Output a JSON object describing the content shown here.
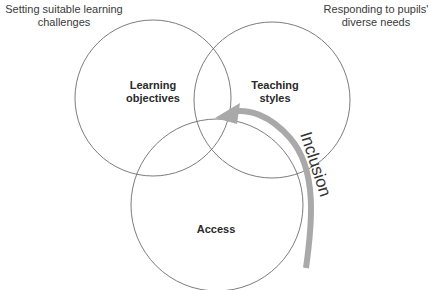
{
  "corner_labels": {
    "top_left": [
      "Setting suitable learning",
      "challenges"
    ],
    "top_right": [
      "Responding to pupils'",
      "diverse needs"
    ]
  },
  "circles": [
    {
      "id": "learning-objectives",
      "label": [
        "Learning",
        "objectives"
      ],
      "cx": 153,
      "cy": 98,
      "r": 78
    },
    {
      "id": "teaching-styles",
      "label": [
        "Teaching",
        "styles"
      ],
      "cx": 272,
      "cy": 100,
      "r": 78
    },
    {
      "id": "access",
      "label": [
        "Access"
      ],
      "cx": 217,
      "cy": 205,
      "r": 86
    }
  ],
  "arrow": {
    "label": "Inclusion",
    "color": "#a9a9a9"
  },
  "colors": {
    "circle_stroke": "#5a5a5a",
    "text": "#2a2a2a"
  }
}
